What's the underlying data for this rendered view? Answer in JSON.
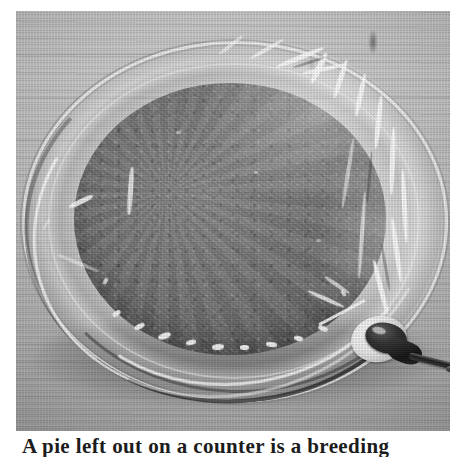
{
  "page": {
    "type": "scanned-book-figure",
    "background_color": "#ffffff",
    "width_px": 461,
    "height_px": 457,
    "rendering": "grayscale halftone print scan"
  },
  "figure": {
    "name": "pie-in-glass-dish-photograph",
    "frame": {
      "left": 16,
      "top": 11,
      "width": 434,
      "height": 420
    },
    "tone_palette": {
      "table_light": "#c9c9c9",
      "table_mid": "#bdbdbd",
      "table_dark": "#a7a7a7",
      "glass_highlight": "#fafafa",
      "filling_mid": "#7e7e7e",
      "filling_dark": "#6a6a6a",
      "shadow": "#1a1a1a",
      "probe_black": "#151515"
    },
    "subjects": [
      {
        "name": "wooden-table-background",
        "tone": "light gray with horizontal grain"
      },
      {
        "name": "glass-pie-dish",
        "tone": "transparent, bright rim highlights"
      },
      {
        "name": "pie-filling",
        "tone": "mid to dark gray, coarse speckled texture"
      },
      {
        "name": "plastic-wrap-covering",
        "tone": "bright crinkled specular highlights"
      },
      {
        "name": "thermometer-probe",
        "tone": "near black with white grommet"
      },
      {
        "name": "probe-cable",
        "tone": "dark gray cable trailing to lower right"
      },
      {
        "name": "dish-shadow",
        "tone": "dark cast shadow beneath dish"
      }
    ]
  },
  "caption": {
    "text": "A pie left out on a counter is a breeding",
    "clipped": true,
    "note": "Only the top few pixels of the caption line are visible at the bottom edge of the page"
  }
}
